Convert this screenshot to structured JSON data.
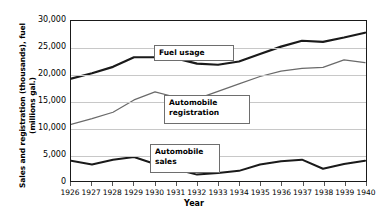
{
  "chart_data": {
    "type": "line",
    "title": "",
    "xlabel": "Year",
    "ylabel": "Sales and registration (thousands), fuel\n(millions gal.)",
    "categories": [
      1926,
      1927,
      1928,
      1929,
      1930,
      1931,
      1932,
      1933,
      1934,
      1935,
      1936,
      1937,
      1938,
      1939,
      1940
    ],
    "x": [
      "1926",
      "1927",
      "1928",
      "1929",
      "1930",
      "1931",
      "1932",
      "1933",
      "1934",
      "1935",
      "1936",
      "1937",
      "1938",
      "1939",
      "1940"
    ],
    "ylim": [
      0,
      30000
    ],
    "yticks": [
      "0",
      "5,000",
      "10,000",
      "15,000",
      "20,000",
      "25,000",
      "30,000"
    ],
    "ytick_values": [
      0,
      5000,
      10000,
      15000,
      20000,
      25000,
      30000
    ],
    "grid": true,
    "legend_position": "inline-callouts",
    "series": [
      {
        "name": "Fuel usage",
        "color": "#1a1a1a",
        "width": 2.2,
        "values": [
          19200,
          20200,
          21400,
          23200,
          23200,
          23000,
          22000,
          21800,
          22400,
          23800,
          25200,
          26300,
          26100,
          26900,
          27800
        ]
      },
      {
        "name": "Automobile registration",
        "color": "#6a6a6a",
        "width": 1.2,
        "values": [
          10600,
          11700,
          12900,
          15200,
          16700,
          15700,
          15400,
          16800,
          18200,
          19600,
          20600,
          21100,
          21300,
          22700,
          22200
        ]
      },
      {
        "name": "Automobile sales",
        "color": "#1a1a1a",
        "width": 2.0,
        "values": [
          3800,
          3100,
          4000,
          4500,
          3200,
          2200,
          1200,
          1500,
          1900,
          3100,
          3700,
          4000,
          2300,
          3200,
          3800
        ]
      }
    ],
    "annotations": [
      {
        "id": "fuel",
        "text": "Fuel usage"
      },
      {
        "id": "registration",
        "text": "Automobile\nregistration"
      },
      {
        "id": "sales",
        "text": "Automobile\nsales"
      }
    ]
  },
  "axes": {
    "y_title": "Sales and registration (thousands), fuel\n(millions gal.)",
    "x_title": "Year"
  }
}
